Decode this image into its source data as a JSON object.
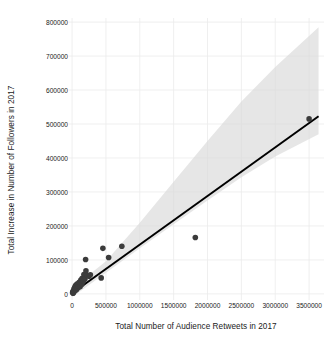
{
  "chart_data": {
    "type": "scatter",
    "title": "",
    "xlabel": "Total Number of Audience Retweets in 2017",
    "ylabel": "Total Increase in Number of Followers in 2017",
    "xlim": [
      -60000,
      3720000
    ],
    "ylim": [
      -18000,
      812000
    ],
    "grid": true,
    "legend": null,
    "xticks": [
      0,
      500000,
      1000000,
      1500000,
      2000000,
      2500000,
      3000000,
      3500000
    ],
    "xtick_labels": [
      "0",
      "500000",
      "1000000",
      "1500000",
      "2000000",
      "2500000",
      "3000000",
      "3500000"
    ],
    "yticks": [
      0,
      100000,
      200000,
      300000,
      400000,
      500000,
      600000,
      700000,
      800000
    ],
    "ytick_labels": [
      "0",
      "100000",
      "200000",
      "300000",
      "400000",
      "500000",
      "600000",
      "700000",
      "800000"
    ],
    "point_color": "#3b3b3b",
    "line_color": "#000000",
    "band_color": "#d9d9d9",
    "grid_color": "#ebebeb",
    "points": [
      {
        "x": 8000,
        "y": 4000
      },
      {
        "x": 12000,
        "y": 6000
      },
      {
        "x": 15000,
        "y": 2000
      },
      {
        "x": 20000,
        "y": 9000
      },
      {
        "x": 24000,
        "y": 5000
      },
      {
        "x": 28000,
        "y": 14000
      },
      {
        "x": 32000,
        "y": 8000
      },
      {
        "x": 38000,
        "y": 18000
      },
      {
        "x": 42000,
        "y": 11000
      },
      {
        "x": 46000,
        "y": 22000
      },
      {
        "x": 52000,
        "y": 16000
      },
      {
        "x": 58000,
        "y": 26000
      },
      {
        "x": 64000,
        "y": 12000
      },
      {
        "x": 70000,
        "y": 20000
      },
      {
        "x": 78000,
        "y": 30000
      },
      {
        "x": 86000,
        "y": 17000
      },
      {
        "x": 95000,
        "y": 24000
      },
      {
        "x": 105000,
        "y": 34000
      },
      {
        "x": 118000,
        "y": 21000
      },
      {
        "x": 130000,
        "y": 41000
      },
      {
        "x": 145000,
        "y": 28000
      },
      {
        "x": 150000,
        "y": 46000
      },
      {
        "x": 168000,
        "y": 37000
      },
      {
        "x": 175000,
        "y": 57000
      },
      {
        "x": 190000,
        "y": 44000
      },
      {
        "x": 200000,
        "y": 101000
      },
      {
        "x": 205000,
        "y": 68000
      },
      {
        "x": 225000,
        "y": 55000
      },
      {
        "x": 250000,
        "y": 52000
      },
      {
        "x": 270000,
        "y": 56000
      },
      {
        "x": 430000,
        "y": 47000
      },
      {
        "x": 455000,
        "y": 134000
      },
      {
        "x": 540000,
        "y": 107000
      },
      {
        "x": 735000,
        "y": 140000
      },
      {
        "x": 1820000,
        "y": 166000
      },
      {
        "x": 3500000,
        "y": 515000
      }
    ],
    "fit_line": {
      "type": "linear-regression",
      "x_start": 0,
      "y_start": 2000,
      "x_end": 3640000,
      "y_end": 523000
    },
    "confidence_band": {
      "description": "95% confidence ribbon around regression line",
      "upper": [
        {
          "x": 0,
          "y": 16000
        },
        {
          "x": 500000,
          "y": 96000
        },
        {
          "x": 1000000,
          "y": 209000
        },
        {
          "x": 1500000,
          "y": 330000
        },
        {
          "x": 2000000,
          "y": 450000
        },
        {
          "x": 2500000,
          "y": 566000
        },
        {
          "x": 3000000,
          "y": 668000
        },
        {
          "x": 3640000,
          "y": 785000
        }
      ],
      "lower": [
        {
          "x": 0,
          "y": -10000
        },
        {
          "x": 500000,
          "y": 62000
        },
        {
          "x": 1000000,
          "y": 134000
        },
        {
          "x": 1500000,
          "y": 205000
        },
        {
          "x": 2000000,
          "y": 275000
        },
        {
          "x": 2500000,
          "y": 343000
        },
        {
          "x": 3000000,
          "y": 404000
        },
        {
          "x": 3640000,
          "y": 470000
        }
      ]
    }
  }
}
